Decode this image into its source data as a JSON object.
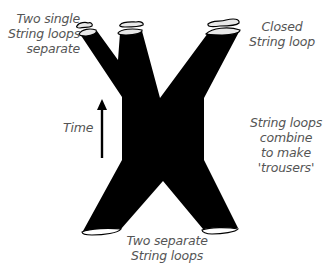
{
  "diagram": {
    "labels": {
      "top_left": [
        "Two single",
        "String loops",
        "separate"
      ],
      "top_right": [
        "Closed",
        "String loop"
      ],
      "time": "Time",
      "right": [
        "String loops combine",
        "to make 'trousers'"
      ],
      "bottom": [
        "Two separate",
        "String loops"
      ]
    },
    "colors": {
      "surface": "#000000",
      "loop_fill": "#e8e8e8",
      "text": "#555555",
      "background": "#ffffff"
    },
    "arrow": {
      "direction": "up",
      "meaning": "time"
    }
  }
}
